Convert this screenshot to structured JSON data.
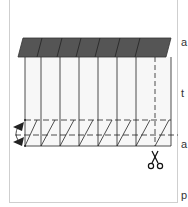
{
  "diagram": {
    "type": "paper-folding-cutting-instruction",
    "colors": {
      "roof": "#555555",
      "lines": "#222222",
      "panel_fill": "#f7f7f7",
      "frame_border": "#cfcfcf"
    },
    "roof": {
      "segments": 7
    },
    "columns": {
      "solid_lines": 8,
      "dashed_line": 1
    },
    "fold_lines": [
      "dashed-upper",
      "dashed-middle"
    ],
    "icons": {
      "fold_arrow": "fold-arrow-icon",
      "scissors": "scissors-icon"
    }
  },
  "side_text": {
    "lines": [
      "a",
      "t",
      "a",
      "p",
      "t",
      "t",
      "t",
      "e",
      "t",
      "e",
      "l"
    ]
  }
}
